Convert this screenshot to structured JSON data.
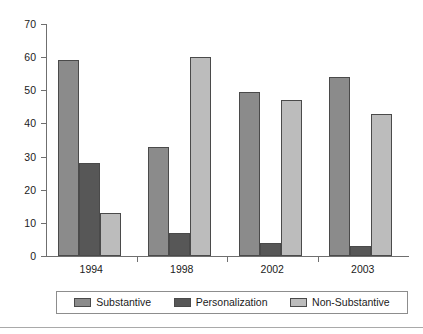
{
  "chart_data": {
    "type": "bar",
    "title": "",
    "xlabel": "",
    "ylabel": "",
    "ylim": [
      0,
      70
    ],
    "yticks": [
      0,
      10,
      20,
      30,
      40,
      50,
      60,
      70
    ],
    "grid": false,
    "legend_position": "bottom",
    "categories": [
      "1994",
      "1998",
      "2002",
      "2003"
    ],
    "series": [
      {
        "name": "Substantive",
        "color": "#8b8b8b",
        "values": [
          59,
          33,
          49.5,
          54
        ]
      },
      {
        "name": "Personalization",
        "color": "#575757",
        "values": [
          28,
          7,
          4,
          3
        ]
      },
      {
        "name": "Non-Substantive",
        "color": "#bcbcbc",
        "values": [
          13,
          60,
          47,
          43
        ]
      }
    ]
  },
  "axis": {
    "y_tick_labels": [
      "70",
      "60",
      "50",
      "40",
      "30",
      "20",
      "10",
      "0"
    ],
    "x_tick_labels": [
      "1994",
      "1998",
      "2002",
      "2003"
    ]
  },
  "legend": {
    "items": [
      {
        "label": "Substantive",
        "color": "#8b8b8b"
      },
      {
        "label": "Personalization",
        "color": "#575757"
      },
      {
        "label": "Non-Substantive",
        "color": "#bcbcbc"
      }
    ]
  },
  "colors": {
    "substantive": "#8b8b8b",
    "personalization": "#575757",
    "non_substantive": "#bcbcbc",
    "axis": "#6f6f6f",
    "bar_outline": "#4a4a4a",
    "text": "#1b1b1b",
    "background": "#ffffff"
  }
}
